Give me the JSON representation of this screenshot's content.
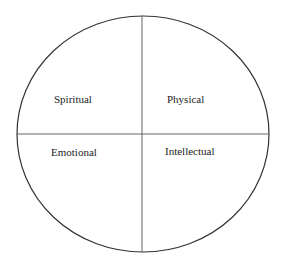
{
  "diagram": {
    "type": "quadrant-circle",
    "quadrants": {
      "top_left": "Spiritual",
      "top_right": "Physical",
      "bottom_left": "Emotional",
      "bottom_right": "Intellectual"
    },
    "colors": {
      "stroke": "#333333",
      "text": "#222222",
      "background": "#ffffff"
    }
  }
}
